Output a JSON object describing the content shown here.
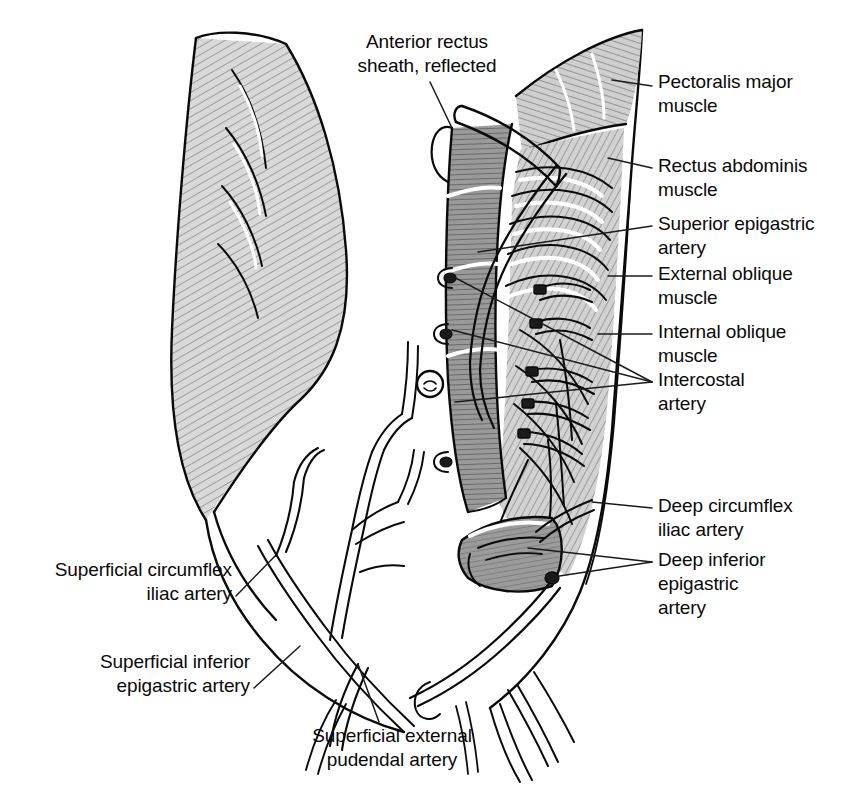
{
  "figure": {
    "view": "anterior dissection, right side of torso reflected",
    "background_color": "#ffffff",
    "ink_color": "#0a0a0a"
  },
  "labels": [
    {
      "id": "anterior-rectus-sheath",
      "text": "Anterior rectus\nsheath, reflected",
      "align": "center",
      "x": 427,
      "y": 30,
      "leader": [
        [
          430,
          82
        ],
        [
          452,
          128
        ]
      ]
    },
    {
      "id": "pectoralis-major",
      "text": "Pectoralis major\nmuscle",
      "align": "left",
      "x": 658,
      "y": 70,
      "leader": [
        [
          652,
          86
        ],
        [
          612,
          80
        ]
      ]
    },
    {
      "id": "rectus-abdominis",
      "text": "Rectus abdominis\nmuscle",
      "align": "left",
      "x": 658,
      "y": 154,
      "leader": [
        [
          652,
          168
        ],
        [
          608,
          158
        ]
      ]
    },
    {
      "id": "superior-epigastric-artery",
      "text": "Superior epigastric\nartery",
      "align": "left",
      "x": 658,
      "y": 212,
      "leader": [
        [
          652,
          226
        ],
        [
          478,
          252
        ]
      ]
    },
    {
      "id": "external-oblique",
      "text": "External oblique\nmuscle",
      "align": "left",
      "x": 658,
      "y": 262,
      "leader": [
        [
          652,
          276
        ],
        [
          608,
          276
        ]
      ]
    },
    {
      "id": "internal-oblique",
      "text": "Internal oblique\nmuscle",
      "align": "left",
      "x": 658,
      "y": 320,
      "leader": [
        [
          652,
          334
        ],
        [
          598,
          334
        ]
      ]
    },
    {
      "id": "intercostal-artery",
      "text": "Intercostal\nartery",
      "align": "left",
      "x": 658,
      "y": 368,
      "leader": [
        [
          652,
          382
        ],
        [
          452,
          276
        ]
      ],
      "leader2": [
        [
          652,
          382
        ],
        [
          452,
          330
        ]
      ],
      "leader3": [
        [
          652,
          382
        ],
        [
          455,
          402
        ]
      ]
    },
    {
      "id": "deep-circumflex-iliac-artery",
      "text": "Deep circumflex\niliac artery",
      "align": "left",
      "x": 658,
      "y": 494,
      "leader": [
        [
          652,
          508
        ],
        [
          592,
          502
        ]
      ]
    },
    {
      "id": "deep-inferior-epigastric-artery",
      "text": "Deep inferior\nepigastric\nartery",
      "align": "left",
      "x": 658,
      "y": 548,
      "leader": [
        [
          652,
          562
        ],
        [
          528,
          548
        ]
      ],
      "leader2": [
        [
          652,
          562
        ],
        [
          546,
          578
        ]
      ]
    },
    {
      "id": "superficial-circumflex-iliac-artery",
      "text": "Superficial circumflex\niliac artery",
      "align": "right",
      "x": 232,
      "y": 558,
      "leader": [
        [
          236,
          596
        ],
        [
          275,
          556
        ]
      ]
    },
    {
      "id": "superficial-inferior-epigastric-artery",
      "text": "Superficial inferior\nepigastric artery",
      "align": "right",
      "x": 250,
      "y": 650,
      "leader": [
        [
          254,
          688
        ],
        [
          300,
          646
        ]
      ]
    },
    {
      "id": "superficial-external-pudendal-artery",
      "text": "Superficial external\npudendal artery",
      "align": "center",
      "x": 392,
      "y": 724,
      "leader": [
        [
          379,
          722
        ],
        [
          358,
          664
        ]
      ]
    }
  ],
  "structures": {
    "torso_left_outline": "reflected skin and muscle flap of left hemi-abdomen",
    "rectus_muscle": "medial rectus abdominis strip with perforators",
    "rib_cage": "slips of external oblique over costal margin",
    "intercostal_vessels": "segmental intercostal arteries with ligature clips",
    "rectus_stump": "cut and reflected inferior rectus abdominis belly",
    "superficial_vessels": "branching superficial inguinal arteries",
    "groin_vessels": "pudendal branches toward pubis"
  }
}
